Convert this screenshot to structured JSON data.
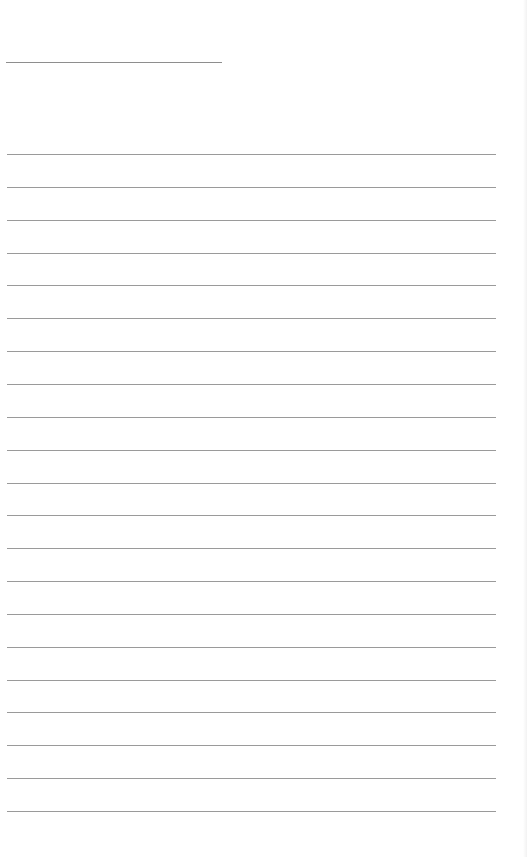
{
  "document": {
    "type": "lined-writing-page",
    "title_line": {
      "x": 6,
      "y": 62,
      "width": 216,
      "color": "#8e8e8e"
    },
    "rules": {
      "count": 21,
      "start_y": 154,
      "spacing": 32.85,
      "x": 7,
      "width": 489,
      "color": "#9a9a9a"
    },
    "background": "#ffffff"
  }
}
